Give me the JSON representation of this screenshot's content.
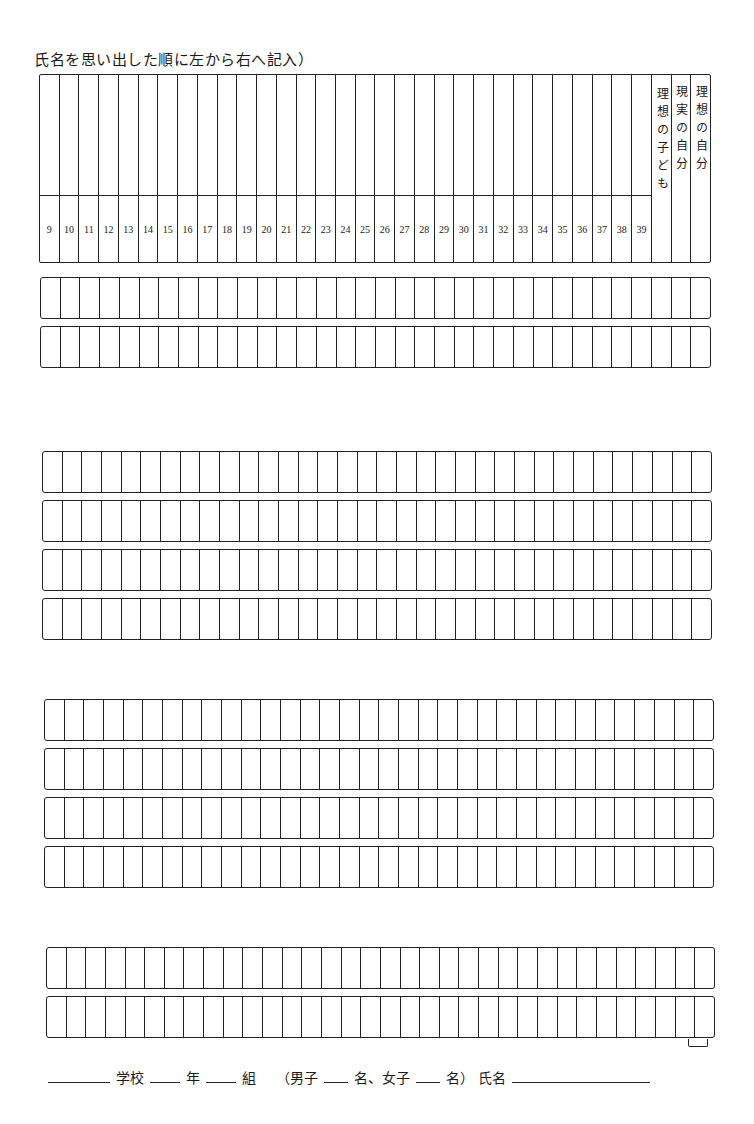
{
  "instruction": "氏名を思い出した順に左から右へ記入）",
  "header": {
    "numbers": [
      "9",
      "10",
      "11",
      "12",
      "13",
      "14",
      "15",
      "16",
      "17",
      "18",
      "19",
      "20",
      "21",
      "22",
      "23",
      "24",
      "25",
      "26",
      "27",
      "28",
      "29",
      "30",
      "31",
      "32",
      "33",
      "34",
      "35",
      "36",
      "37",
      "38",
      "39"
    ],
    "labels": [
      {
        "text": "理想の子ども"
      },
      {
        "text": "現実の自分"
      },
      {
        "text": "理想の自分"
      }
    ]
  },
  "grid": {
    "columns_per_row": 34,
    "groups": [
      {
        "rows": 2
      },
      {
        "rows": 4
      },
      {
        "rows": 4
      },
      {
        "rows": 2
      }
    ]
  },
  "footer": {
    "school_label": "学校",
    "grade_label": "年",
    "class_label": "組",
    "boys_prefix": "（男子",
    "boys_suffix": "名、",
    "girls_prefix": "女子",
    "girls_suffix": "名）",
    "name_label": "氏名",
    "school_value": "",
    "grade_value": "",
    "class_value": "",
    "boys_value": "",
    "girls_value": "",
    "name_value": ""
  }
}
